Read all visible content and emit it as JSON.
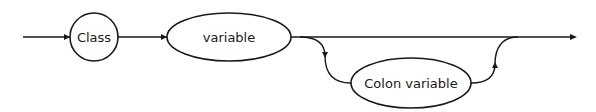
{
  "diagram": {
    "type": "syntax-railroad",
    "nodes": [
      {
        "id": "class",
        "label": "Class",
        "shape": "circle"
      },
      {
        "id": "variable",
        "label": "variable",
        "shape": "ellipse"
      },
      {
        "id": "colon_variable",
        "label": "Colon variable",
        "shape": "ellipse",
        "optional": true
      }
    ],
    "edges": [
      {
        "from": "start",
        "to": "class"
      },
      {
        "from": "class",
        "to": "variable"
      },
      {
        "from": "variable",
        "to": "end"
      },
      {
        "from": "variable",
        "to": "colon_variable",
        "kind": "optional-branch"
      },
      {
        "from": "colon_variable",
        "to": "end",
        "kind": "rejoin"
      }
    ],
    "colors": {
      "stroke": "#1a1a1a",
      "background": "#ffffff"
    }
  }
}
